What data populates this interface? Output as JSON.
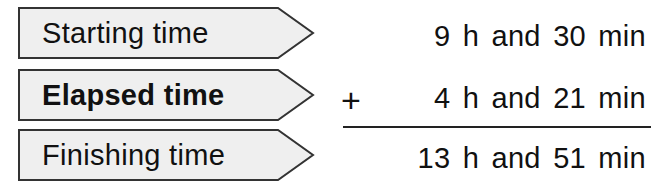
{
  "rows": [
    {
      "label": "Starting time",
      "label_bold": false,
      "value": "9 h and 30 min"
    },
    {
      "label": "Elapsed time",
      "label_bold": true,
      "value": "4 h and 21 min"
    },
    {
      "label": "Finishing time",
      "label_bold": false,
      "value": "13 h and 51 min"
    }
  ],
  "operator": "+",
  "colors": {
    "arrow_fill": "#efefef",
    "arrow_stroke": "#333333",
    "text": "#111111"
  }
}
